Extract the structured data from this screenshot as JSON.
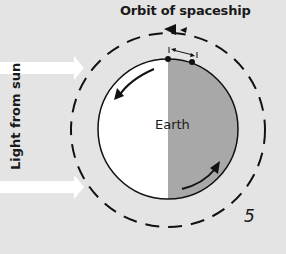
{
  "figure": {
    "title": "Orbit of spaceship",
    "earth_label": "Earth",
    "side_label": "Light from sun",
    "figure_number": "5"
  },
  "colors": {
    "background": "#e4e4e4",
    "day_side": "#ffffff",
    "night_side": "#a8a8a8",
    "ink": "#111111"
  }
}
